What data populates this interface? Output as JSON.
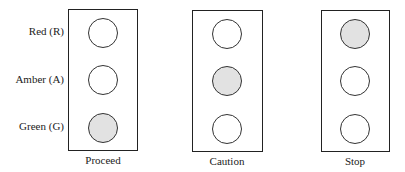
{
  "row_labels": [
    "Red (R)",
    "Amber (A)",
    "Green (G)"
  ],
  "signals": [
    {
      "caption": "Proceed",
      "lit": "green",
      "lamps": [
        "off",
        "off",
        "on"
      ]
    },
    {
      "caption": "Caution",
      "lit": "amber",
      "lamps": [
        "off",
        "on",
        "off"
      ]
    },
    {
      "caption": "Stop",
      "lit": "red",
      "lamps": [
        "on",
        "off",
        "off"
      ]
    }
  ],
  "colors": {
    "lit_fill": "#e2e2e2",
    "unlit_fill": "#ffffff",
    "outline": "#222222"
  }
}
